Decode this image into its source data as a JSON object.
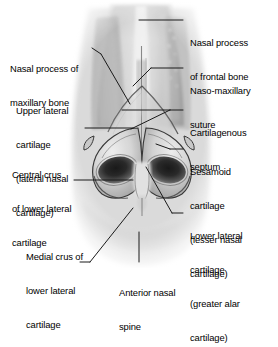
{
  "figure": {
    "view": "anterior (frontal) view of nasal skeleton specimen",
    "medium": "black-and-white anatomical photograph with leader-line annotations",
    "background_color": "#ffffff",
    "text_color": "#000000",
    "leader_color": "#1a1a1a"
  },
  "labels": {
    "nasal_process_frontal": {
      "lines": [
        "Nasal process",
        "of frontal bone"
      ],
      "side": "right",
      "target": "superior midline bony bridge / nasal process of frontal bone"
    },
    "naso_maxillary_suture": {
      "lines": [
        "Naso-maxillary",
        "suture"
      ],
      "side": "right",
      "target": "suture line between nasal bone and maxilla, right side"
    },
    "cartilagenous_septum": {
      "lines": [
        "Cartilagenous",
        "septum"
      ],
      "side": "right",
      "target": "midline cartilaginous septum below nasal bones"
    },
    "sesamoid_cartilage": {
      "lines": [
        "Sesamoid",
        "cartilage",
        "(lesser nasal",
        "cartilage)"
      ],
      "side": "right",
      "target": "small sesamoid cartilage lateral to greater alar cartilage"
    },
    "lower_lateral_cartilage": {
      "lines": [
        "Lower lateral",
        "cartilage",
        "(greater alar",
        "cartilage)"
      ],
      "side": "right",
      "target": "greater alar cartilage forming the right nostril rim"
    },
    "nasal_process_maxillary": {
      "lines": [
        "Nasal process of",
        "maxillary bone"
      ],
      "side": "left",
      "target": "frontal process of the maxilla, left side"
    },
    "upper_lateral_cartilage": {
      "lines": [
        "Upper lateral",
        "cartilage",
        "(lateral nasal",
        "cartilage)"
      ],
      "side": "left",
      "target": "upper lateral (lateral nasal) cartilage, left side"
    },
    "central_crus": {
      "lines": [
        "Central crus",
        "of lower lateral",
        "cartilage"
      ],
      "side": "left",
      "target": "central (intermediate) crus of lower lateral cartilage"
    },
    "medial_crus": {
      "lines": [
        "Medial crus of",
        "lower lateral",
        "cartilage"
      ],
      "side": "left",
      "target": "medial crus of lower lateral cartilage in the columella"
    },
    "anterior_nasal_spine": {
      "lines": [
        "Anterior nasal",
        "spine"
      ],
      "side": "bottom",
      "target": "anterior nasal spine of the maxilla at the nasal base"
    }
  }
}
